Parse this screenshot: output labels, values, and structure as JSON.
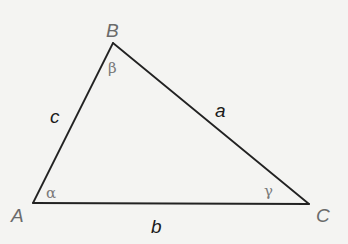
{
  "diagram": {
    "title": "",
    "type": "triangle",
    "colors": {
      "background": "#f4f4f2",
      "edge": "#222222",
      "vertex_label": "#6b6b6b",
      "side_label": "#1a1a1a",
      "angle_label": "#7a7a7a"
    },
    "vertices": [
      {
        "id": "A",
        "label": "A",
        "x": 33,
        "y": 203
      },
      {
        "id": "B",
        "label": "B",
        "x": 113,
        "y": 43
      },
      {
        "id": "C",
        "label": "C",
        "x": 309,
        "y": 204
      }
    ],
    "sides": [
      {
        "id": "a",
        "label": "a",
        "from": "B",
        "to": "C"
      },
      {
        "id": "b",
        "label": "b",
        "from": "A",
        "to": "C"
      },
      {
        "id": "c",
        "label": "c",
        "from": "A",
        "to": "B"
      }
    ],
    "angles": [
      {
        "vertex": "A",
        "label": "α"
      },
      {
        "vertex": "B",
        "label": "β"
      },
      {
        "vertex": "C",
        "label": "γ"
      }
    ]
  }
}
